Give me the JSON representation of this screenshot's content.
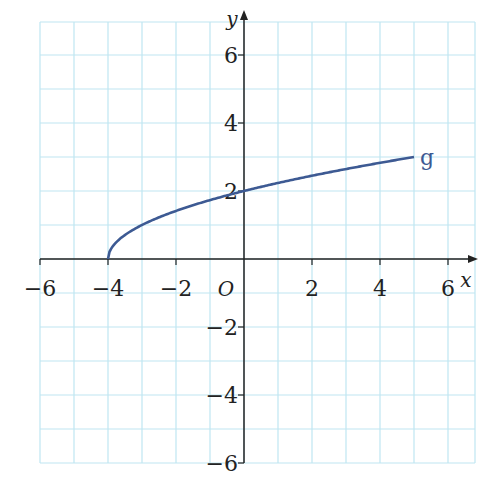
{
  "chart_data": {
    "type": "line",
    "title": "",
    "xlabel": "x",
    "ylabel": "y",
    "origin_label": "O",
    "xlim": [
      -6,
      6.6
    ],
    "ylim": [
      -6,
      6.6
    ],
    "x_ticks": [
      -6,
      -4,
      -2,
      2,
      4,
      6
    ],
    "y_ticks": [
      -6,
      -4,
      -2,
      2,
      4,
      6
    ],
    "grid": true,
    "grid_step": 1,
    "series": [
      {
        "name": "g",
        "function": "sqrt(x+4)",
        "x": [
          -4,
          -3.75,
          -3,
          -2,
          -1,
          0,
          1,
          2,
          3,
          4,
          5
        ],
        "values": [
          0,
          0.5,
          1,
          1.41,
          1.73,
          2,
          2.24,
          2.45,
          2.65,
          2.83,
          3
        ],
        "color": "#3d5a93"
      }
    ],
    "grid_color": "#bfe6f2",
    "axis_color": "#222222"
  }
}
